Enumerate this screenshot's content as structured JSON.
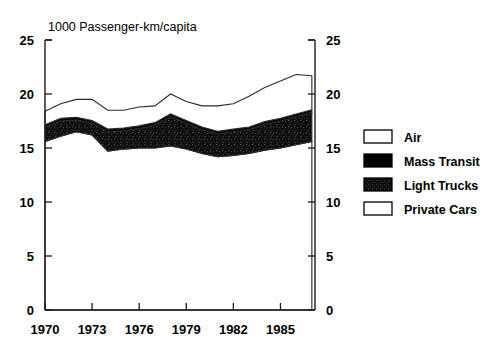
{
  "chart_data": {
    "type": "area",
    "title": "",
    "subtitle": "",
    "xlabel": "",
    "ylabel": "1000 Passenger-km/capita",
    "ylim": [
      0,
      25
    ],
    "xlim": [
      1970,
      1987.2
    ],
    "yticks": [
      0,
      5,
      10,
      15,
      20,
      25
    ],
    "ytick_labels": [
      "0",
      "5",
      "10",
      "15",
      "20",
      "25"
    ],
    "xticks": [
      1970,
      1973,
      1976,
      1979,
      1982,
      1985
    ],
    "xtick_labels": [
      "1970",
      "1973",
      "1976",
      "1979",
      "1982",
      "1985"
    ],
    "grid": false,
    "stacked": true,
    "legend_position": "right",
    "right_axis_mirrored": true,
    "x": [
      1970,
      1971,
      1972,
      1973,
      1974,
      1975,
      1976,
      1977,
      1978,
      1979,
      1980,
      1981,
      1982,
      1983,
      1984,
      1985,
      1986,
      1987
    ],
    "series": [
      {
        "name": "Private Cars",
        "fill": "white",
        "values": [
          15.6,
          16.1,
          16.5,
          16.2,
          14.7,
          14.9,
          15.0,
          15.0,
          15.2,
          14.9,
          14.5,
          14.2,
          14.3,
          14.5,
          14.8,
          15.0,
          15.3,
          15.6
        ]
      },
      {
        "name": "Light Trucks",
        "fill": "dither-dark",
        "values": [
          1.3,
          1.4,
          1.1,
          1.1,
          1.8,
          1.7,
          1.8,
          2.1,
          2.7,
          2.4,
          2.2,
          2.1,
          2.2,
          2.2,
          2.4,
          2.5,
          2.6,
          2.7
        ]
      },
      {
        "name": "Mass Transit",
        "fill": "black",
        "values": [
          0.25,
          0.25,
          0.25,
          0.25,
          0.25,
          0.25,
          0.25,
          0.25,
          0.25,
          0.25,
          0.25,
          0.25,
          0.25,
          0.25,
          0.25,
          0.25,
          0.25,
          0.25
        ]
      },
      {
        "name": "Air",
        "fill": "white",
        "values": [
          1.25,
          1.35,
          1.65,
          1.95,
          1.75,
          1.65,
          1.75,
          1.55,
          1.85,
          1.75,
          1.95,
          2.35,
          2.35,
          2.85,
          3.15,
          3.45,
          3.65,
          3.15
        ]
      }
    ],
    "cumulative_private_cars": [
      15.6,
      16.1,
      16.5,
      16.2,
      14.7,
      14.9,
      15.0,
      15.0,
      15.2,
      14.9,
      14.5,
      14.2,
      14.3,
      14.5,
      14.8,
      15.0,
      15.3,
      15.6
    ],
    "cumulative_light_trucks": [
      16.9,
      17.5,
      17.6,
      17.3,
      16.5,
      16.6,
      16.8,
      17.1,
      17.9,
      17.3,
      16.7,
      16.3,
      16.5,
      16.7,
      17.2,
      17.5,
      17.9,
      18.3
    ],
    "cumulative_mass_transit": [
      17.15,
      17.75,
      17.85,
      17.55,
      16.75,
      16.85,
      17.05,
      17.35,
      18.15,
      17.55,
      16.95,
      16.55,
      16.75,
      16.95,
      17.45,
      17.75,
      18.15,
      18.55
    ],
    "cumulative_total": [
      18.4,
      19.1,
      19.5,
      19.5,
      18.5,
      18.5,
      18.8,
      18.9,
      20.0,
      19.3,
      18.9,
      18.9,
      19.1,
      19.8,
      20.6,
      21.2,
      21.8,
      21.7
    ]
  },
  "axes": {
    "y_axis_label": "1000 Passenger-km/capita",
    "left_tick_labels": [
      "25",
      "20",
      "15",
      "10",
      "5",
      "0"
    ],
    "right_tick_labels": [
      "25",
      "20",
      "15",
      "10",
      "5",
      "0"
    ],
    "x_tick_labels": [
      "1970",
      "1973",
      "1976",
      "1979",
      "1982",
      "1985"
    ]
  },
  "legend": {
    "items": [
      {
        "label": "Air",
        "style": "white",
        "swatch_name": "legend-swatch-air"
      },
      {
        "label": "Mass Transit",
        "style": "black",
        "swatch_name": "legend-swatch-mass-transit"
      },
      {
        "label": "Light Trucks",
        "style": "dither-dark",
        "swatch_name": "legend-swatch-light-trucks"
      },
      {
        "label": "Private Cars",
        "style": "white",
        "swatch_name": "legend-swatch-private-cars"
      }
    ]
  },
  "colors": {
    "background": "#ffffff",
    "ink": "#000000",
    "axis": "#1a1a1a",
    "band_white": "#ffffff",
    "band_black": "#000000",
    "band_dither": "#151515",
    "outline": "#2b2b2b"
  }
}
